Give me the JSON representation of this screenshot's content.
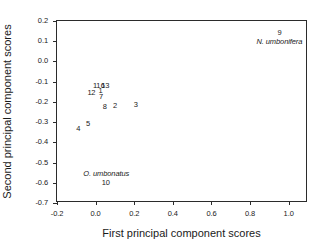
{
  "chart_data": {
    "type": "scatter",
    "title": "",
    "xlabel": "First principal component scores",
    "ylabel": "Second principal component scores",
    "xlim": [
      -0.2,
      1.1
    ],
    "ylim": [
      -0.7,
      0.2
    ],
    "xticks": [
      "-0.2",
      "0.0",
      "0.2",
      "0.4",
      "0.6",
      "0.8",
      "1.0"
    ],
    "xtick_values": [
      -0.2,
      0.0,
      0.2,
      0.4,
      0.6,
      0.8,
      1.0
    ],
    "yticks": [
      "0.2",
      "0.1",
      "0.0",
      "-0.1",
      "-0.2",
      "-0.3",
      "-0.4",
      "-0.5",
      "-0.6",
      "-0.7"
    ],
    "ytick_values": [
      0.2,
      0.1,
      0.0,
      -0.1,
      -0.2,
      -0.3,
      -0.4,
      -0.5,
      -0.6,
      -0.7
    ],
    "grid": false,
    "legend": "none",
    "marker_style": "numeric-text-label",
    "points": [
      {
        "label": "11",
        "x": 0.005,
        "y": -0.122
      },
      {
        "label": "6",
        "x": 0.037,
        "y": -0.121
      },
      {
        "label": "13",
        "x": 0.05,
        "y": -0.121
      },
      {
        "label": "12",
        "x": -0.022,
        "y": -0.158
      },
      {
        "label": "1",
        "x": 0.025,
        "y": -0.147
      },
      {
        "label": "7",
        "x": 0.028,
        "y": -0.176
      },
      {
        "label": "8",
        "x": 0.047,
        "y": -0.227
      },
      {
        "label": "2",
        "x": 0.1,
        "y": -0.219
      },
      {
        "label": "3",
        "x": 0.208,
        "y": -0.215
      },
      {
        "label": "5",
        "x": -0.04,
        "y": -0.31
      },
      {
        "label": "4",
        "x": -0.09,
        "y": -0.336
      },
      {
        "label": "10",
        "x": 0.052,
        "y": -0.6
      },
      {
        "label": "9",
        "x": 0.952,
        "y": 0.139
      }
    ],
    "annotations": [
      {
        "text": "N. umbonifera",
        "x": 0.952,
        "y": 0.098,
        "style": "italic"
      },
      {
        "text": "O. umbonatus",
        "x": 0.055,
        "y": -0.558,
        "style": "italic"
      }
    ]
  }
}
